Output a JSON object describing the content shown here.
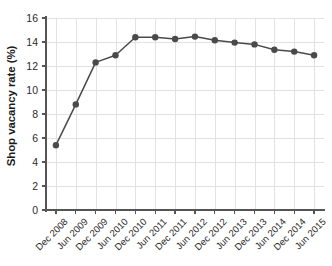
{
  "chart_data": {
    "type": "line",
    "title": "",
    "xlabel": "",
    "ylabel": "Shop vacancy rate (%)",
    "categories": [
      "Dec 2008",
      "Jun 2009",
      "Dec 2009",
      "Jun 2010",
      "Dec 2010",
      "Jun 2011",
      "Dec 2011",
      "Jun 2012",
      "Dec 2012",
      "Jun 2013",
      "Dec 2013",
      "Jun 2014",
      "Dec 2014",
      "Jun 2015"
    ],
    "values": [
      5.4,
      8.8,
      12.3,
      12.9,
      14.4,
      14.4,
      14.25,
      14.45,
      14.15,
      13.95,
      13.8,
      13.35,
      13.2,
      12.9
    ],
    "series": [
      {
        "name": "Shop vacancy rate",
        "values": [
          5.4,
          8.8,
          12.3,
          12.9,
          14.4,
          14.4,
          14.25,
          14.45,
          14.15,
          13.95,
          13.8,
          13.35,
          13.2,
          12.9
        ]
      }
    ],
    "ylim": [
      0,
      16
    ],
    "yticks": [
      0,
      2,
      4,
      6,
      8,
      10,
      12,
      14,
      16
    ],
    "ytick_labels": [
      "0",
      "2",
      "4",
      "6",
      "8",
      "10",
      "12",
      "14",
      "16"
    ],
    "grid": true,
    "legend": "none",
    "colors": {
      "line": "#4a4a4a",
      "marker": "#4a4a4a",
      "grid": "#e2e2e2",
      "axis": "#555555",
      "background": "#ffffff",
      "text": "#2b2b2b"
    }
  }
}
